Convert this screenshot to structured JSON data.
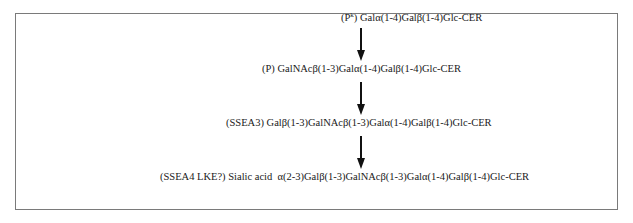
{
  "diagram": {
    "type": "biosynthetic-pathway",
    "steps": [
      {
        "label": "(P",
        "label_sup": "k",
        "label_close": ")",
        "chain": "Galα(1-4)Galβ(1-4)Glc-CER"
      },
      {
        "label": "(P)",
        "chain": "GalNAcβ(1-3)Galα(1-4)Galβ(1-4)Glc-CER"
      },
      {
        "label": "(SSEA3)",
        "chain": "Galβ(1-3)GalNAcβ(1-3)Galα(1-4)Galβ(1-4)Glc-CER"
      },
      {
        "label": "(SSEA4 LKE?)",
        "chain": "Sialic acid  α(2-3)Galβ(1-3)GalNAcβ(1-3)Galα(1-4)Galβ(1-4)Glc-CER"
      }
    ],
    "arrows": [
      {
        "from": 0,
        "to": 1
      },
      {
        "from": 1,
        "to": 2
      },
      {
        "from": 2,
        "to": 3
      }
    ]
  }
}
